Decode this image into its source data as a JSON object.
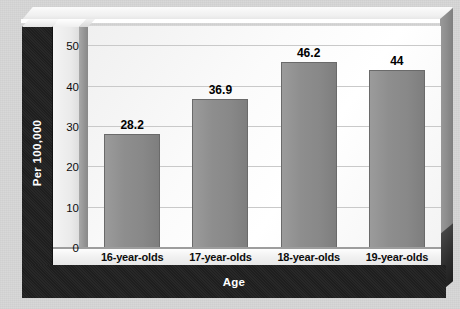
{
  "chart_data": {
    "type": "bar",
    "title": "",
    "xlabel": "Age",
    "ylabel": "Per 100,000",
    "categories": [
      "16-year-olds",
      "17-year-olds",
      "18-year-olds",
      "19-year-olds"
    ],
    "values": [
      28.2,
      36.9,
      46.2,
      44
    ],
    "value_labels": [
      "28.2",
      "36.9",
      "46.2",
      "44"
    ],
    "ylim": [
      0,
      55
    ],
    "yticks": [
      0,
      10,
      20,
      30,
      40,
      50
    ],
    "ytick_labels": [
      "0",
      "10",
      "20",
      "30",
      "40",
      "50"
    ],
    "grid": true,
    "legend": false,
    "legend_position": "none",
    "colors": {
      "bar_fill": "#8e8e8e",
      "bar_edge": "#6a6a6a",
      "plot_background": "#fbfbfb",
      "gridline": "#c9c9c9",
      "axis_band": "#202020",
      "axis_band_text": "#ffffff",
      "page_background": "#d6d6d6",
      "label_text": "#000000"
    }
  }
}
